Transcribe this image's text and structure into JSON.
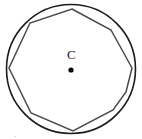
{
  "figure": {
    "width": 142,
    "height": 139,
    "background_color": "#ffffff",
    "center_label": "C",
    "center_label_position": {
      "x": 69,
      "y": 55
    },
    "center_point": {
      "x": 71,
      "y": 70,
      "radius": 2.6,
      "color": "#000000"
    },
    "circle": {
      "name": "circumscribed-circle",
      "cx": 71,
      "cy": 69,
      "r": 64.5,
      "stroke": "#1c1c1c",
      "stroke_width": 1.6,
      "fill": "none"
    },
    "polygon": {
      "name": "inscribed-polygon",
      "sides": 9,
      "stroke": "#4a4a52",
      "stroke_width": 1.5,
      "fill": "none",
      "vertices": [
        {
          "x": 72,
          "y": 9
        },
        {
          "x": 111,
          "y": 30
        },
        {
          "x": 132,
          "y": 68
        },
        {
          "x": 126,
          "y": 92
        },
        {
          "x": 113,
          "y": 110
        },
        {
          "x": 73,
          "y": 131
        },
        {
          "x": 31,
          "y": 113
        },
        {
          "x": 9,
          "y": 68
        },
        {
          "x": 30,
          "y": 23
        }
      ]
    },
    "bottom_caption": "."
  }
}
